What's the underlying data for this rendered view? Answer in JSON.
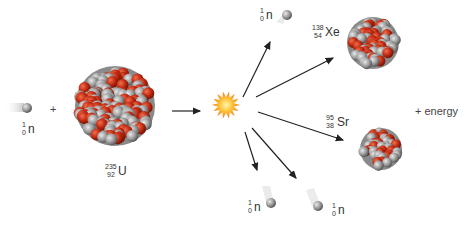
{
  "diagram": {
    "incoming_neutron": {
      "symbol": "n",
      "mass": "1",
      "atomic": "0"
    },
    "plus_sign": "+",
    "uranium": {
      "symbol": "U",
      "mass": "235",
      "atomic": "92"
    },
    "products": {
      "xenon": {
        "symbol": "Xe",
        "mass": "138",
        "atomic": "54"
      },
      "strontium": {
        "symbol": "Sr",
        "mass": "95",
        "atomic": "38"
      },
      "neutron_top": {
        "symbol": "n",
        "mass": "1",
        "atomic": "0"
      },
      "neutron_bottom_left": {
        "symbol": "n",
        "mass": "1",
        "atomic": "0"
      },
      "neutron_bottom_right": {
        "symbol": "n",
        "mass": "1",
        "atomic": "0"
      }
    },
    "energy_label": "+ energy",
    "colors": {
      "proton": "#c0280f",
      "neutron": "#9a9a9a",
      "arrow": "#222222",
      "burst": "#f5a623"
    }
  }
}
